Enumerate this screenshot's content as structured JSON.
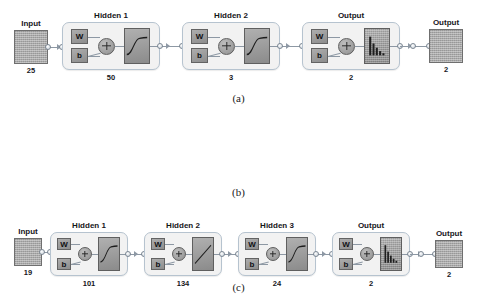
{
  "figure": {
    "type": "neural-network-architecture-diagram",
    "panels": [
      {
        "caption": "(a)",
        "input": {
          "label": "Input",
          "value": "25"
        },
        "output": {
          "label": "Output",
          "value": "2"
        },
        "layers": [
          {
            "title": "Hidden 1",
            "value": "50",
            "w": "W",
            "b": "b",
            "transfer": "sigmoid"
          },
          {
            "title": "Hidden 2",
            "value": "3",
            "w": "W",
            "b": "b",
            "transfer": "sigmoid"
          },
          {
            "title": "Output",
            "value": "2",
            "w": "W",
            "b": "b",
            "transfer": "softmax"
          }
        ]
      },
      {
        "caption": "(b)",
        "input": {
          "label": "Input",
          "value": "19"
        },
        "output": {
          "label": "Output",
          "value": "2"
        },
        "layers": [
          {
            "title": "Hidden 1",
            "value": "101",
            "w": "W",
            "b": "b",
            "transfer": "sigmoid"
          },
          {
            "title": "Hidden 2",
            "value": "134",
            "w": "W",
            "b": "b",
            "transfer": "sigmoid"
          },
          {
            "title": "Hidden 3",
            "value": "24",
            "w": "W",
            "b": "b",
            "transfer": "sigmoid"
          },
          {
            "title": "Output",
            "value": "2",
            "w": "W",
            "b": "b",
            "transfer": "softmax"
          }
        ]
      },
      {
        "caption": "(c)",
        "input": {
          "label": "Input",
          "value": "6"
        },
        "output": {
          "label": "Output",
          "value": "2"
        },
        "layers": [
          {
            "title": "Hidden 1",
            "value": "131",
            "w": "W",
            "b": "b",
            "transfer": "sigmoid"
          },
          {
            "title": "Hidden 2",
            "value": "131",
            "w": "W",
            "b": "b",
            "transfer": "sigmoid"
          },
          {
            "title": "Hidden 3",
            "value": "5",
            "w": "W",
            "b": "b",
            "transfer": "sigmoid"
          },
          {
            "title": "Output",
            "value": "2",
            "w": "W",
            "b": "b",
            "transfer": "softmax"
          }
        ]
      }
    ]
  },
  "colors": {
    "background": "#ffffff",
    "layer_fill": "#f2f2f2",
    "layer_border": "#b6c3cf",
    "block_fill": "#9a9a9a",
    "block_border": "#636363",
    "wire": "#8d98a4",
    "text": "#17171c"
  }
}
